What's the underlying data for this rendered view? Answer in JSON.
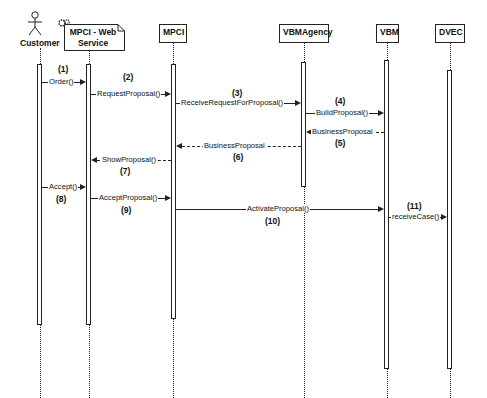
{
  "diagram": {
    "type": "uml-sequence-diagram",
    "participants": [
      {
        "id": "customer",
        "label": "Customer",
        "kind": "actor"
      },
      {
        "id": "mpci_ws",
        "label_line1": "MPCI - Web",
        "label_line2": "Service",
        "kind": "web-service"
      },
      {
        "id": "mpci",
        "label": "MPCI",
        "kind": "object"
      },
      {
        "id": "vbmagency",
        "label": "VBMAgency",
        "kind": "object"
      },
      {
        "id": "vbm",
        "label": "VBM",
        "kind": "object"
      },
      {
        "id": "dvec",
        "label": "DVEC",
        "kind": "object"
      }
    ],
    "messages": [
      {
        "num": "(1)",
        "label": "Order()",
        "from": "customer",
        "to": "mpci_ws",
        "style": "solid"
      },
      {
        "num": "(2)",
        "label": "RequestProposal()",
        "from": "mpci_ws",
        "to": "mpci",
        "style": "solid"
      },
      {
        "num": "(3)",
        "label": "ReceiveRequestForProposal()",
        "from": "mpci",
        "to": "vbmagency",
        "style": "solid"
      },
      {
        "num": "(4)",
        "label": "BuildProposal()",
        "from": "vbmagency",
        "to": "vbm",
        "style": "solid"
      },
      {
        "num": "(5)",
        "label": "BusinessProposal",
        "from": "vbm",
        "to": "vbmagency",
        "style": "dashed"
      },
      {
        "num": "(6)",
        "label": "BusinessProposal",
        "from": "vbmagency",
        "to": "mpci",
        "style": "dashed"
      },
      {
        "num": "(7)",
        "label": "ShowProposal()",
        "from": "mpci",
        "to": "mpci_ws",
        "style": "dashed"
      },
      {
        "num": "(8)",
        "label": "Accept()",
        "from": "customer",
        "to": "mpci_ws",
        "style": "solid"
      },
      {
        "num": "(9)",
        "label": "AcceptProposal()",
        "from": "mpci_ws",
        "to": "mpci",
        "style": "solid"
      },
      {
        "num": "(10)",
        "label": "ActivateProposal()",
        "from": "mpci",
        "to": "vbm",
        "style": "solid"
      },
      {
        "num": "(11)",
        "label": "receiveCase()",
        "from": "vbm",
        "to": "dvec",
        "style": "solid"
      }
    ]
  }
}
